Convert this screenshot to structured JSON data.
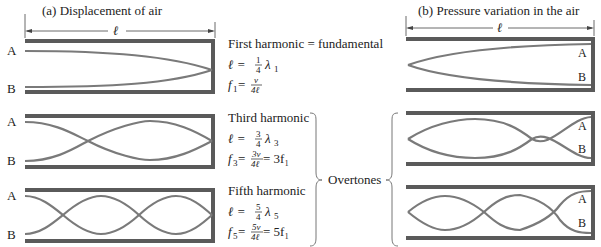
{
  "panel_a": {
    "title": "(a)  Displacement of air",
    "length_symbol": "ℓ",
    "end_label_a": "A",
    "end_label_b": "B"
  },
  "panel_b": {
    "title": "(b)  Pressure variation in the air",
    "length_symbol": "ℓ",
    "end_label_a": "A",
    "end_label_b": "B"
  },
  "harmonics": [
    {
      "name": "First harmonic",
      "suffix": " = fundamental",
      "len_lhs": "ℓ = ",
      "len_num": "1",
      "len_den": "4",
      "len_rhs": "λ",
      "len_sub": "1",
      "f_lhs": "f",
      "f_sub": "1",
      "f_eq": " = ",
      "f_num": "v",
      "f_den": "4ℓ",
      "f_rhs": ""
    },
    {
      "name": "Third harmonic",
      "suffix": "",
      "len_lhs": "ℓ = ",
      "len_num": "3",
      "len_den": "4",
      "len_rhs": "λ",
      "len_sub": "3",
      "f_lhs": "f",
      "f_sub": "3",
      "f_eq": " = ",
      "f_num": "3v",
      "f_den": "4ℓ",
      "f_rhs": " = 3f₁"
    },
    {
      "name": "Fifth harmonic",
      "suffix": "",
      "len_lhs": "ℓ = ",
      "len_num": "5",
      "len_den": "4",
      "len_rhs": "λ",
      "len_sub": "5",
      "f_lhs": "f",
      "f_sub": "5",
      "f_eq": " = ",
      "f_num": "5v",
      "f_den": "4ℓ",
      "f_rhs": " = 5f₁"
    }
  ],
  "overtones_label": "Overtones",
  "colors": {
    "wall": "#5a5a5a",
    "curve": "#7a7a7a",
    "text": "#222222"
  }
}
